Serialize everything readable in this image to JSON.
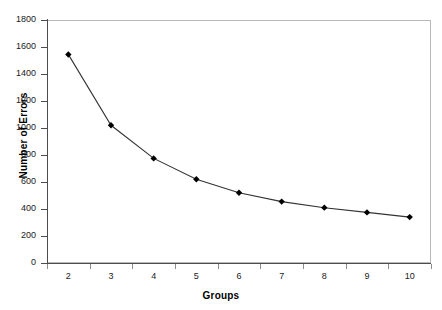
{
  "chart_data": {
    "type": "line",
    "title": "",
    "xlabel": "Groups",
    "ylabel": "Number of Errors",
    "categories": [
      "2",
      "3",
      "4",
      "5",
      "6",
      "7",
      "8",
      "9",
      "10"
    ],
    "values": [
      1545,
      1020,
      775,
      620,
      520,
      455,
      410,
      375,
      340
    ],
    "series": [
      {
        "name": "Number of Errors",
        "values": [
          1545,
          1020,
          775,
          620,
          520,
          455,
          410,
          375,
          340
        ]
      }
    ],
    "ylim": [
      0,
      1800
    ],
    "ytick_step": 200,
    "yticks": [
      0,
      200,
      400,
      600,
      800,
      1000,
      1200,
      1400,
      1600,
      1800
    ],
    "ytick_labels": [
      "0",
      "200",
      "400",
      "600",
      "800",
      "1000",
      "1200",
      "1400",
      "1600",
      "1800"
    ],
    "grid": false,
    "legend": false,
    "legend_position": "none",
    "marker": "diamond",
    "marker_color": "#000000",
    "line_color": "#333333",
    "plot_background": "#ffffff",
    "border_color": "#b9b9b9"
  }
}
